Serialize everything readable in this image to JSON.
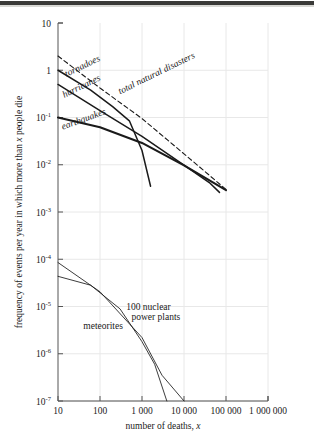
{
  "figure": {
    "background": "#ffffff",
    "grid_color": "#e8e8e8",
    "axis_color": "#555555",
    "curve_color": "#1a1a1a"
  },
  "chart_data": {
    "type": "line",
    "title": "",
    "xlabel": "number of deaths, x",
    "ylabel": "frequency of events per year in which more than x people die",
    "xscale": "log",
    "yscale": "log",
    "xlim": [
      10,
      1000000
    ],
    "ylim": [
      1e-07,
      10
    ],
    "grid": true,
    "legend": "inline-labels",
    "xticks": [
      10,
      100,
      1000,
      10000,
      100000,
      1000000
    ],
    "xtick_labels": [
      "10",
      "100",
      "1 000",
      "10 000",
      "100 000",
      "1 000 000"
    ],
    "yticks": [
      10,
      1,
      0.1,
      0.01,
      0.001,
      0.0001,
      1e-05,
      1e-06,
      1e-07
    ],
    "ytick_labels": [
      "10",
      "1",
      "10-1",
      "10-2",
      "10-3",
      "10-4",
      "10-5",
      "10-6",
      "10-7"
    ],
    "ytick_mantissa": [
      "10",
      "1",
      "10",
      "10",
      "10",
      "10",
      "10",
      "10",
      "10"
    ],
    "ytick_exponent": [
      "",
      "",
      "-1",
      "-2",
      "-3",
      "-4",
      "-5",
      "-6",
      "-7"
    ],
    "series": [
      {
        "name": "total natural disasters",
        "style": "dashed",
        "label": "total natural disasters",
        "label_italic": true,
        "points": [
          [
            10,
            2.0
          ],
          [
            100,
            0.42
          ],
          [
            1000,
            0.095
          ],
          [
            10000,
            0.017
          ],
          [
            40000,
            0.006
          ],
          [
            100000,
            0.003
          ]
        ]
      },
      {
        "name": "tornadoes",
        "style": "solid",
        "label": "tornadoes",
        "label_italic": true,
        "points": [
          [
            10,
            1.0
          ],
          [
            60,
            0.38
          ],
          [
            200,
            0.17
          ],
          [
            500,
            0.085
          ],
          [
            1000,
            0.02
          ],
          [
            1600,
            0.0035
          ]
        ]
      },
      {
        "name": "hurricanes",
        "style": "solid",
        "label": "hurricanes",
        "label_italic": true,
        "points": [
          [
            10,
            0.5
          ],
          [
            100,
            0.14
          ],
          [
            1000,
            0.04
          ],
          [
            10000,
            0.0098
          ],
          [
            40000,
            0.0042
          ],
          [
            70000,
            0.0026
          ]
        ]
      },
      {
        "name": "earthquakes",
        "style": "solid-thick",
        "label": "earthquakes",
        "label_italic": true,
        "points": [
          [
            10,
            0.1
          ],
          [
            100,
            0.062
          ],
          [
            1000,
            0.029
          ],
          [
            10000,
            0.0097
          ],
          [
            100000,
            0.0029
          ]
        ]
      },
      {
        "name": "meteorites",
        "style": "solid-thin",
        "label": "meteorites",
        "label_italic": false,
        "points": [
          [
            10,
            8.52e-05
          ],
          [
            100,
            2.05e-05
          ],
          [
            1000,
            2.2e-06
          ],
          [
            3000,
            3.5e-07
          ],
          [
            10000,
            1e-07
          ]
        ]
      },
      {
        "name": "100 nuclear power plants",
        "style": "solid-thin",
        "label_line1": "100 nuclear",
        "label_line2": "power plants",
        "label_italic": false,
        "points": [
          [
            10,
            4.35e-05
          ],
          [
            60,
            2.82e-05
          ],
          [
            300,
            8.9e-06
          ],
          [
            1000,
            1.8e-06
          ],
          [
            2000,
            6e-07
          ],
          [
            3900,
            1e-07
          ]
        ]
      }
    ],
    "annotations": [
      {
        "text": "tornadoes",
        "x": 16,
        "y": 0.72,
        "rotation": -26,
        "italic": true
      },
      {
        "text": "hurricanes",
        "x": 14,
        "y": 0.26,
        "rotation": -26,
        "italic": true
      },
      {
        "text": "earthquakes",
        "x": 13,
        "y": 0.055,
        "rotation": -20,
        "italic": true
      },
      {
        "text": "total natural disasters",
        "x": 300,
        "y": 0.31,
        "rotation": -26,
        "italic": true
      },
      {
        "text": "meteorites",
        "x": 40,
        "y": 3.3e-06,
        "rotation": 0,
        "italic": false
      },
      {
        "text": "100 nuclear",
        "x": 420,
        "y": 8.5e-06,
        "rotation": 0,
        "italic": false
      },
      {
        "text": "power plants",
        "x": 560,
        "y": 5.2e-06,
        "rotation": 0,
        "italic": false
      }
    ]
  }
}
